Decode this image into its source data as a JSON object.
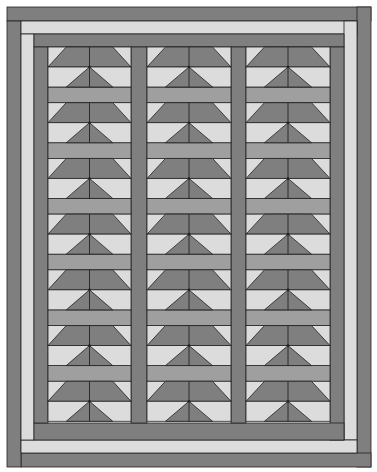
{
  "pattern": {
    "name": "Tree block quilt with sashing and log-cabin border",
    "block_columns": 3,
    "block_rows": 7,
    "total_blocks": 21
  },
  "colors": {
    "background": "#ffffff",
    "dark": "#7f7f7f",
    "medium": "#9f9f9f",
    "light": "#dcdcdc",
    "outline": "#222222"
  }
}
